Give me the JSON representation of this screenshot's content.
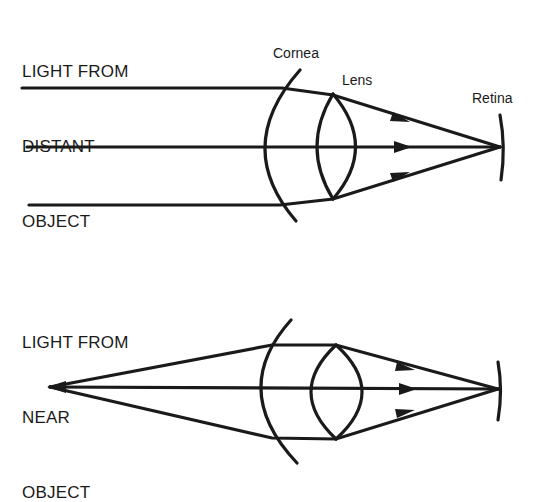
{
  "figure": {
    "colors": {
      "ink": "#1a1a1a",
      "background": "#ffffff"
    }
  },
  "top_panel": {
    "caption_lines": [
      "LIGHT FROM",
      "DISTANT",
      "OBJECT"
    ],
    "labels": {
      "cornea": "Cornea",
      "lens": "Lens",
      "retina": "Retina"
    },
    "rays": [
      {
        "name": "upper",
        "points": [
          [
            22,
            88
          ],
          [
            282,
            88
          ],
          [
            333,
            95
          ],
          [
            500,
            147
          ]
        ]
      },
      {
        "name": "middle",
        "points": [
          [
            27,
            147
          ],
          [
            500,
            147
          ]
        ]
      },
      {
        "name": "lower",
        "points": [
          [
            29,
            205
          ],
          [
            280,
            205
          ],
          [
            333,
            199
          ],
          [
            500,
            147
          ]
        ]
      }
    ],
    "arrows_at_x": 400,
    "focal_point": [
      500,
      147
    ]
  },
  "bottom_panel": {
    "caption_lines": [
      "LIGHT FROM",
      "NEAR",
      "OBJECT"
    ],
    "object_point": [
      50,
      387
    ],
    "rays": [
      {
        "name": "upper",
        "points": [
          [
            50,
            387
          ],
          [
            272,
            345
          ],
          [
            336,
            345
          ],
          [
            498,
            389
          ]
        ]
      },
      {
        "name": "middle",
        "points": [
          [
            50,
            387
          ],
          [
            498,
            389
          ]
        ]
      },
      {
        "name": "lower",
        "points": [
          [
            50,
            387
          ],
          [
            272,
            438
          ],
          [
            336,
            439
          ],
          [
            498,
            389
          ]
        ]
      }
    ],
    "arrows_at_x": 408,
    "focal_point": [
      498,
      389
    ]
  }
}
